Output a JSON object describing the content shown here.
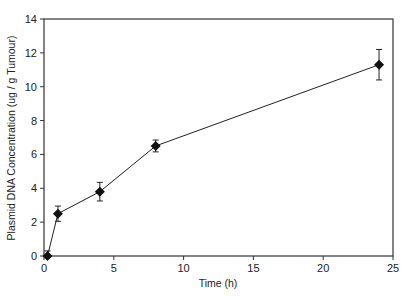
{
  "chart_data": {
    "type": "line",
    "title": "",
    "xlabel": "Time (h)",
    "ylabel": "Plasmid DNA Concentration (ug / g Tumour)",
    "xlim": [
      0,
      25
    ],
    "ylim": [
      0,
      14
    ],
    "xticks": [
      0,
      5,
      10,
      15,
      20,
      25
    ],
    "yticks": [
      0,
      2,
      4,
      6,
      8,
      10,
      12,
      14
    ],
    "grid": false,
    "legend": null,
    "marker": "diamond",
    "series": [
      {
        "name": "Plasmid DNA",
        "x": [
          0.25,
          1,
          4,
          8,
          24
        ],
        "y": [
          0.0,
          2.5,
          3.8,
          6.5,
          11.3
        ],
        "error": [
          0.3,
          0.45,
          0.55,
          0.35,
          0.9
        ]
      }
    ]
  },
  "colors": {
    "line": "#222222",
    "marker": "#111111",
    "axis": "#333333"
  }
}
